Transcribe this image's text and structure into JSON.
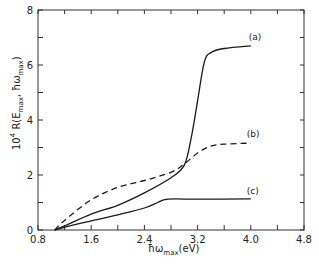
{
  "chart_data": {
    "type": "line",
    "title": "",
    "xlabel": "ħω_max (eV)",
    "ylabel": "10⁴ R(E_max, ħω_max)",
    "xlim": [
      0.8,
      4.8
    ],
    "ylim": [
      0,
      8
    ],
    "x_ticks": [
      0.8,
      1.2,
      1.6,
      2.0,
      2.4,
      2.8,
      3.2,
      3.6,
      4.0,
      4.4,
      4.8
    ],
    "x_tick_labels": [
      "0.8",
      "",
      "1.6",
      "",
      "2.4",
      "",
      "3.2",
      "",
      "4.0",
      "",
      "4.8"
    ],
    "y_ticks": [
      0,
      1,
      2,
      3,
      4,
      5,
      6,
      7,
      8
    ],
    "y_tick_labels": [
      "0",
      "",
      "2",
      "",
      "4",
      "",
      "6",
      "",
      "8"
    ],
    "grid": false,
    "legend": "inline labels at curve ends",
    "series": [
      {
        "name": "(a)",
        "style": "solid",
        "x": [
          1.05,
          1.2,
          1.6,
          2.0,
          2.4,
          2.8,
          3.0,
          3.1,
          3.2,
          3.3,
          3.4,
          3.6,
          4.0
        ],
        "values": [
          0,
          0.15,
          0.58,
          0.9,
          1.35,
          1.9,
          2.36,
          3.3,
          4.7,
          6.1,
          6.45,
          6.6,
          6.7
        ]
      },
      {
        "name": "(b)",
        "style": "dashed",
        "x": [
          1.05,
          1.2,
          1.6,
          2.0,
          2.4,
          2.8,
          3.0,
          3.2,
          3.4,
          3.6,
          4.0
        ],
        "values": [
          0,
          0.35,
          1.1,
          1.55,
          1.8,
          2.1,
          2.4,
          2.8,
          3.05,
          3.12,
          3.16
        ]
      },
      {
        "name": "(c)",
        "style": "solid",
        "x": [
          1.05,
          1.2,
          1.6,
          2.0,
          2.4,
          2.6,
          2.75,
          3.2,
          4.0
        ],
        "values": [
          0,
          0.1,
          0.33,
          0.55,
          0.8,
          1.0,
          1.12,
          1.12,
          1.13
        ]
      }
    ]
  },
  "axes": {
    "x_title_main": "ħω",
    "x_title_sub": "max",
    "x_title_unit": "(eV)",
    "y_title_prefix": "10",
    "y_title_exp": "4",
    "y_title_body": " R(E",
    "y_title_sub1": "max",
    "y_title_mid": ", ħω",
    "y_title_sub2": "max",
    "y_title_end": ")"
  },
  "colors": {
    "line": "#1a1a1a",
    "axis": "#333333",
    "background": "#ffffff"
  }
}
